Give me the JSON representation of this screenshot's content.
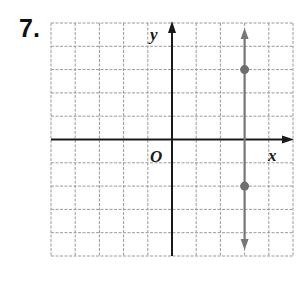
{
  "problem": {
    "number": "7."
  },
  "axes": {
    "x_label": "x",
    "y_label": "y",
    "origin_label": "O"
  },
  "grid": {
    "x_min": -5,
    "x_max": 5,
    "y_min": -5,
    "y_max": 5,
    "step": 1
  },
  "colors": {
    "axis": "#1a1a1a",
    "grid": "#9a9a9a",
    "line": "#777777",
    "point": "#6e6e6e"
  },
  "chart_data": {
    "type": "line",
    "title": "",
    "xlabel": "x",
    "ylabel": "y",
    "xlim": [
      -5,
      5
    ],
    "ylim": [
      -5,
      5
    ],
    "grid": true,
    "series": [
      {
        "name": "vertical line x = 3",
        "x": [
          3,
          3
        ],
        "y": [
          -5,
          5
        ],
        "arrows": "both"
      }
    ],
    "points": [
      {
        "x": 3,
        "y": 3
      },
      {
        "x": 3,
        "y": -2
      }
    ],
    "annotations": [
      "O"
    ]
  }
}
